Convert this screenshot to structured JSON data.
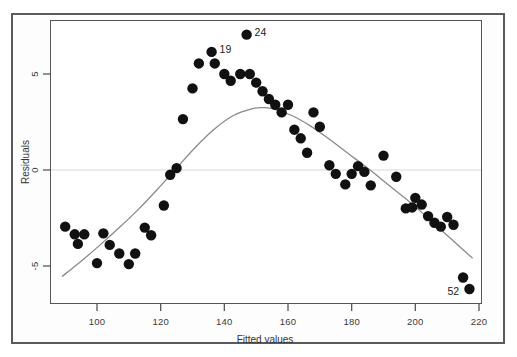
{
  "figure": {
    "background_color": "#ffffff",
    "frame_color": "#5a5a5a",
    "panel_border_color": "#555555"
  },
  "chart_data": {
    "type": "scatter",
    "title": "",
    "subtitle": "",
    "xlabel": "Fitted values",
    "ylabel": "Residuals",
    "xlim": [
      88,
      222
    ],
    "ylim": [
      -7.2,
      7.6
    ],
    "xticks": [
      100,
      120,
      140,
      160,
      180,
      200,
      220
    ],
    "xticklabels": [
      "100",
      "120",
      "140",
      "160",
      "180",
      "200",
      "220"
    ],
    "yticks": [
      5,
      0,
      -5
    ],
    "yticklabels": [
      "5",
      "0",
      "-5"
    ],
    "grid": false,
    "legend": null,
    "reference_lines": [
      {
        "name": "zero-line",
        "orientation": "horizontal",
        "y": 0,
        "color": "#d9d9d9"
      }
    ],
    "marker": {
      "shape": "circle",
      "color": "#111111",
      "size": 5.2
    },
    "series": [
      {
        "name": "residuals",
        "x": [
          90,
          93,
          94,
          96,
          100,
          102,
          104,
          107,
          110,
          112,
          115,
          117,
          121,
          123,
          125,
          127,
          130,
          132,
          136,
          137,
          140,
          142,
          145,
          147,
          148,
          150,
          152,
          154,
          156,
          158,
          160,
          162,
          164,
          166,
          168,
          170,
          173,
          175,
          178,
          180,
          182,
          184,
          186,
          190,
          194,
          197,
          199,
          200,
          202,
          204,
          206,
          208,
          210,
          212,
          215,
          217
        ],
        "y": [
          -2.95,
          -3.35,
          -3.85,
          -3.35,
          -4.85,
          -3.3,
          -3.9,
          -4.35,
          -4.9,
          -4.35,
          -3.0,
          -3.4,
          -1.85,
          -0.25,
          0.1,
          2.65,
          4.25,
          5.55,
          6.15,
          5.55,
          5.0,
          4.65,
          5.0,
          7.05,
          5.0,
          4.55,
          4.1,
          3.7,
          3.4,
          3.0,
          3.4,
          2.1,
          1.65,
          0.9,
          3.0,
          2.25,
          0.25,
          -0.2,
          -0.75,
          -0.2,
          0.2,
          -0.1,
          -0.8,
          0.75,
          -0.35,
          -2.0,
          -1.95,
          -1.45,
          -1.8,
          -2.4,
          -2.75,
          -2.95,
          -2.45,
          -2.85,
          -5.6,
          -6.2
        ]
      }
    ],
    "smoother": {
      "name": "lowess-curve",
      "color": "#8a8a8a",
      "x": [
        89,
        95,
        101,
        107,
        113,
        119,
        125,
        131,
        137,
        143,
        149,
        152,
        155,
        161,
        167,
        173,
        179,
        185,
        191,
        197,
        203,
        209,
        215,
        218
      ],
      "y": [
        -5.55,
        -4.75,
        -3.9,
        -3.0,
        -2.05,
        -1.0,
        0.1,
        1.2,
        2.15,
        2.85,
        3.2,
        3.25,
        3.2,
        2.85,
        2.3,
        1.6,
        0.85,
        0.1,
        -0.7,
        -1.5,
        -2.35,
        -3.25,
        -4.15,
        -4.6
      ]
    },
    "annotations": [
      {
        "label": "19",
        "x": 136,
        "y": 6.15,
        "dx": 8,
        "dy": -9
      },
      {
        "label": "24",
        "x": 147,
        "y": 7.05,
        "dx": 8,
        "dy": -9
      },
      {
        "label": "52",
        "x": 217,
        "y": -6.2,
        "dx": -22,
        "dy": -4
      }
    ]
  },
  "axes": {
    "x_title": "Fitted values",
    "y_title": "Residuals",
    "x_tick_labels": [
      "100",
      "120",
      "140",
      "160",
      "180",
      "200",
      "220"
    ],
    "y_tick_labels": [
      "5",
      "0",
      "-5"
    ]
  }
}
